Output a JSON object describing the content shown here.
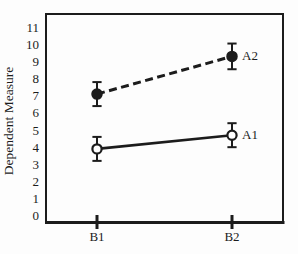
{
  "figure": {
    "background": "#fdfdfd"
  },
  "chart_data": {
    "type": "line",
    "title": "",
    "xlabel": "",
    "ylabel": "Dependent Measure",
    "categories": [
      "B1",
      "B2"
    ],
    "series": [
      {
        "name": "A2",
        "values": [
          7.1,
          9.3
        ],
        "errors": [
          0.7,
          0.75
        ],
        "line_style": "dashed",
        "marker": "filled-circle"
      },
      {
        "name": "A1",
        "values": [
          3.9,
          4.7
        ],
        "errors": [
          0.7,
          0.7
        ],
        "line_style": "solid",
        "marker": "open-circle"
      }
    ],
    "ylim": [
      0,
      11
    ],
    "yticks": [
      0,
      1,
      2,
      3,
      4,
      5,
      6,
      7,
      8,
      9,
      10,
      11
    ],
    "grid": false,
    "legend_position": "inline-right-of-last-point",
    "ink_color": "#1c1c1c"
  }
}
